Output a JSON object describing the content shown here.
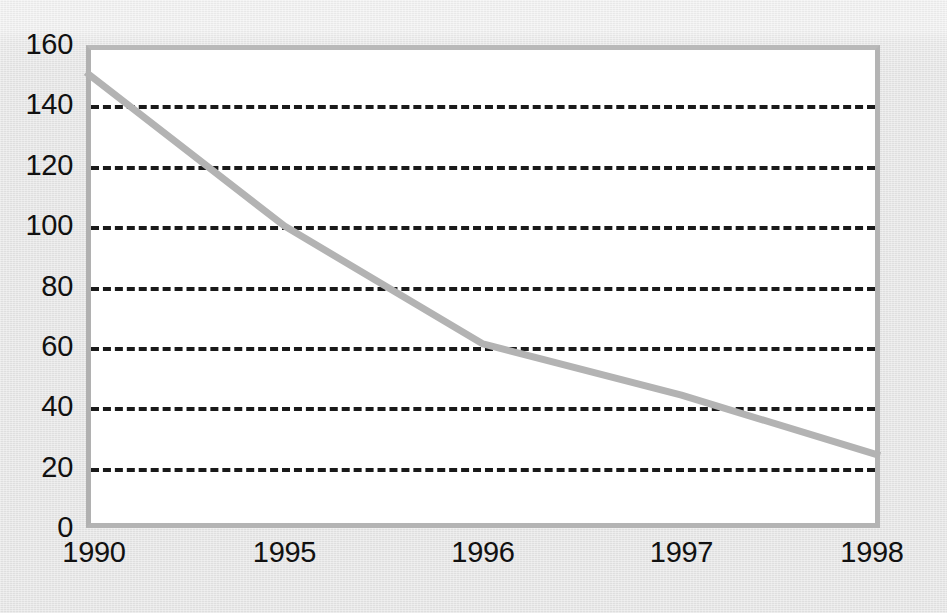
{
  "chart_data": {
    "type": "line",
    "title": "",
    "subtitle": "",
    "xlabel": "",
    "ylabel": "",
    "categories": [
      "1990",
      "1995",
      "1996",
      "1997",
      "1998"
    ],
    "series": [
      {
        "name": "series-1",
        "values": [
          151,
          100,
          61,
          44,
          24
        ],
        "color": "#b3b3b3"
      }
    ],
    "ylim": [
      0,
      160
    ],
    "ytick_values": [
      0,
      20,
      40,
      60,
      80,
      100,
      120,
      140,
      160
    ],
    "ytick_labels": [
      "0",
      "20",
      "40",
      "60",
      "80",
      "100",
      "120",
      "140",
      "160"
    ],
    "gridline_values": [
      20,
      40,
      60,
      80,
      100,
      120,
      140
    ],
    "grid": "horizontal-dashed",
    "legend": "none",
    "plot_background": "#ffffff",
    "page_background": "#e7e7e7",
    "frame_color": "#b4b4b4",
    "grid_color": "#1a1a1a",
    "text_color": "#111111"
  },
  "axes": {
    "y_labels": [
      "160",
      "140",
      "120",
      "100",
      "80",
      "60",
      "40",
      "20",
      "0"
    ],
    "x_labels": [
      "1990",
      "1995",
      "1996",
      "1997",
      "1998"
    ]
  }
}
